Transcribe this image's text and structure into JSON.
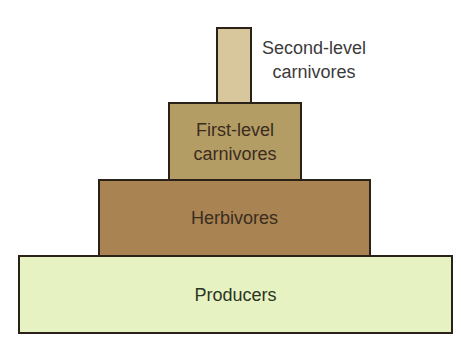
{
  "diagram": {
    "title": "",
    "type": "trophic-pyramid",
    "levels": [
      {
        "id": "second-level-carnivores",
        "label_line1": "Second-level",
        "label_line2": "carnivores",
        "label_position": "outside-right",
        "color": "#d8c69d"
      },
      {
        "id": "first-level-carnivores",
        "label_line1": "First-level",
        "label_line2": "carnivores",
        "label_position": "inside",
        "color": "#b49c65"
      },
      {
        "id": "herbivores",
        "label_line1": "Herbivores",
        "label_position": "inside",
        "color": "#a98452"
      },
      {
        "id": "producers",
        "label_line1": "Producers",
        "label_position": "inside",
        "color": "#e7f2c3"
      }
    ],
    "border_color": "#2a2218"
  }
}
